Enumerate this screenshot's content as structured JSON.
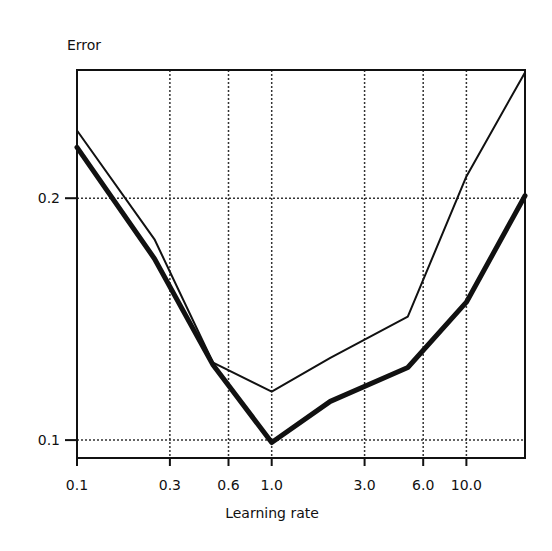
{
  "chart_data": {
    "type": "line",
    "title": "",
    "xlabel": "Learning rate",
    "ylabel": "Error",
    "xscale": "log",
    "yscale": "linear",
    "xlim": [
      0.1,
      20.0
    ],
    "ylim": [
      0.0926,
      0.253
    ],
    "x_ticks": [
      {
        "value": 0.1,
        "label": "0.1"
      },
      {
        "value": 0.3,
        "label": "0.3"
      },
      {
        "value": 0.6,
        "label": "0.6"
      },
      {
        "value": 1.0,
        "label": "1.0"
      },
      {
        "value": 3.0,
        "label": "3.0"
      },
      {
        "value": 6.0,
        "label": "6.0"
      },
      {
        "value": 10.0,
        "label": "10.0"
      }
    ],
    "y_ticks": [
      {
        "value": 0.1,
        "label": "0.1"
      },
      {
        "value": 0.2,
        "label": "0.2"
      }
    ],
    "grid": true,
    "legend": null,
    "x": [
      0.1,
      0.25,
      0.5,
      1.0,
      2.0,
      5.0,
      10.0,
      20.0
    ],
    "series": [
      {
        "name": "thin line",
        "style": "thin",
        "values": [
          0.228,
          0.183,
          0.132,
          0.12,
          0.134,
          0.151,
          0.209,
          0.252
        ]
      },
      {
        "name": "thick line",
        "style": "thick",
        "values": [
          0.221,
          0.175,
          0.131,
          0.099,
          0.116,
          0.13,
          0.157,
          0.201
        ]
      }
    ]
  },
  "colors": {
    "line": "#111111",
    "grid": "#333333",
    "background": "#ffffff"
  }
}
